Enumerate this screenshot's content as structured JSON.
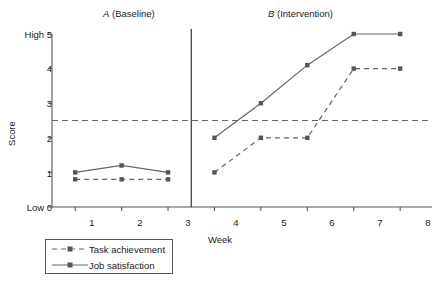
{
  "chart_data": {
    "type": "line",
    "title": "",
    "subtitle": "",
    "xlabel": "Week",
    "ylabel": "Score",
    "x": [
      1,
      2,
      3,
      4,
      5,
      6,
      7,
      8
    ],
    "xlim": [
      0.4,
      8.5
    ],
    "ylim": [
      0,
      5
    ],
    "xticks": [
      "1",
      "2",
      "3",
      "4",
      "5",
      "6",
      "7",
      "8"
    ],
    "yticks": [
      "0",
      "1",
      "2",
      "3",
      "4",
      "5"
    ],
    "ytick_labels": [
      "Low 0",
      "1",
      "2",
      "3",
      "4",
      "High 5"
    ],
    "grid": false,
    "legend_position": "below-left",
    "series": [
      {
        "name": "Task achievement",
        "style": "dashed",
        "marker": "square",
        "color": "#666666",
        "values": [
          0.8,
          0.8,
          0.8,
          1.0,
          2.0,
          2.0,
          4.0,
          4.0
        ]
      },
      {
        "name": "Job satisfaction",
        "style": "solid",
        "marker": "square",
        "color": "#666666",
        "values": [
          1.0,
          1.2,
          1.0,
          2.0,
          3.0,
          4.1,
          5.0,
          5.0
        ]
      }
    ],
    "annotations": {
      "phase_divider_x": 3.5,
      "reference_line_y": 2.5,
      "reference_line_style": "dashed"
    }
  },
  "phases": {
    "a": {
      "letter": "A",
      "name": "(Baseline)"
    },
    "b": {
      "letter": "B",
      "name": "(Intervention)"
    }
  },
  "axis": {
    "y_title": "Score",
    "x_title": "Week",
    "y_labels": {
      "t5": "High 5",
      "t4": "4",
      "t3": "3",
      "t2": "2",
      "t1": "1",
      "t0": "Low 0"
    },
    "x_labels": {
      "w1": "1",
      "w2": "2",
      "w3": "3",
      "w4": "4",
      "w5": "5",
      "w6": "6",
      "w7": "7",
      "w8": "8"
    }
  },
  "legend": {
    "items": [
      {
        "label": "Task achievement"
      },
      {
        "label": "Job satisfaction"
      }
    ]
  },
  "caption": {
    "text": ""
  },
  "colors": {
    "line": "#666666",
    "axis": "#555555",
    "text": "#1a1a1a"
  }
}
